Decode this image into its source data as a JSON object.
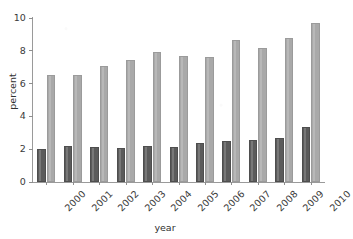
{
  "chart_data": {
    "type": "bar",
    "title": "",
    "subtitle": "",
    "xlabel": "year",
    "ylabel": "percent",
    "categories": [
      "2000",
      "2001",
      "2002",
      "2003",
      "2004",
      "2005",
      "2006",
      "2007",
      "2008",
      "2009",
      "2010"
    ],
    "series": [
      {
        "name": "dark-series",
        "color": "#5b5b5b",
        "values": [
          2.0,
          2.2,
          2.15,
          2.1,
          2.2,
          2.15,
          2.35,
          2.5,
          2.55,
          2.7,
          3.35
        ]
      },
      {
        "name": "light-series",
        "color": "#a9a9a9",
        "values": [
          6.5,
          6.5,
          7.05,
          7.45,
          7.9,
          7.7,
          7.6,
          8.65,
          8.15,
          8.8,
          9.7
        ]
      }
    ],
    "ylim": [
      0,
      10
    ],
    "yticks": [
      0,
      2,
      4,
      6,
      8,
      10
    ],
    "ytick_labels": [
      "0",
      "2",
      "4",
      "6",
      "8",
      "10"
    ],
    "xtick_labels": [
      "2000",
      "2001",
      "2002",
      "2003",
      "2004",
      "2005",
      "2006",
      "2007",
      "2008",
      "2009",
      "2010"
    ],
    "xtick_rotation": -45,
    "grid": false,
    "legend": null,
    "legend_position": "none",
    "annotations": []
  },
  "axes": {
    "y_axis_title": "percent",
    "x_axis_title": "year"
  },
  "colors": {
    "background": "#ffffff",
    "axis": "#9a9a9a",
    "text": "#3a3a3a",
    "series_dark": "#5b5b5b",
    "series_light": "#a9a9a9"
  }
}
